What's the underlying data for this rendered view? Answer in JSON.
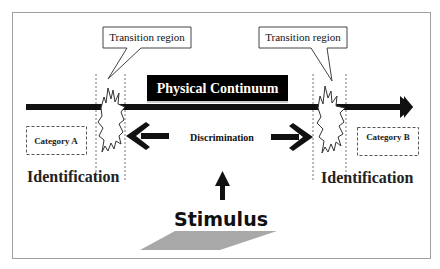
{
  "diagram": {
    "title_box": "Physical Continuum",
    "callout_left": "Transition region",
    "callout_right": "Transition region",
    "category_a": "Category A",
    "category_b": "Category B",
    "discrimination": "Discrimination",
    "identification_left": "Identification",
    "identification_right": "Identification",
    "stimulus": "Stimulus",
    "colors": {
      "frame": "#a0a0a0",
      "ink": "#111111",
      "title_bg": "#000000",
      "title_text": "#ffffff",
      "stimulus_plane": "#a8a8a8"
    }
  }
}
